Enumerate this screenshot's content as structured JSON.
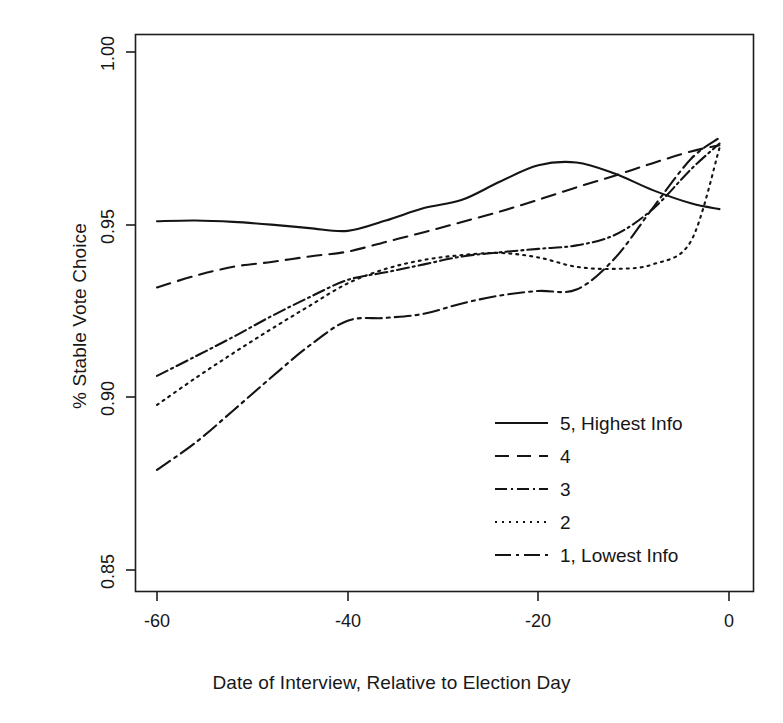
{
  "chart_data": {
    "type": "line",
    "title": "",
    "xlabel": "Date of Interview, Relative to Election Day",
    "ylabel": "% Stable Vote Choice",
    "xlim": [
      -64,
      -0.5
    ],
    "ylim": [
      0.845,
      1.003
    ],
    "xticks": [
      -60,
      -40,
      -20,
      0
    ],
    "xtick_labels": [
      "-60",
      "-40",
      "-20",
      "0"
    ],
    "yticks": [
      0.85,
      0.9,
      0.95,
      1.0
    ],
    "ytick_labels": [
      "0.85",
      "0.90",
      "0.95",
      "1.00"
    ],
    "grid": false,
    "legend_position": "bottom-right",
    "x": [
      -60,
      -56,
      -52,
      -48,
      -44,
      -40,
      -36,
      -32,
      -28,
      -24,
      -20,
      -16,
      -12,
      -8,
      -4,
      -1
    ],
    "series": [
      {
        "name": "5, Highest Info",
        "label": "5, Highest Info",
        "dash": "solid",
        "dasharray": "none",
        "color": "#141414",
        "values": [
          0.951,
          0.9512,
          0.9508,
          0.95,
          0.949,
          0.9482,
          0.9512,
          0.9548,
          0.9572,
          0.9625,
          0.9672,
          0.968,
          0.9648,
          0.96,
          0.9562,
          0.9545
        ]
      },
      {
        "name": "4",
        "label": "4",
        "dash": "dashed",
        "dasharray": "14,8",
        "color": "#141414",
        "values": [
          0.9318,
          0.9352,
          0.9378,
          0.9392,
          0.9408,
          0.9422,
          0.945,
          0.9478,
          0.9508,
          0.9538,
          0.9572,
          0.9608,
          0.9642,
          0.9678,
          0.9712,
          0.973
        ]
      },
      {
        "name": "3",
        "label": "3",
        "dash": "dash-dot",
        "dasharray": "12,4,2,4",
        "color": "#141414",
        "values": [
          0.9062,
          0.9118,
          0.9175,
          0.9235,
          0.929,
          0.934,
          0.9362,
          0.9385,
          0.9408,
          0.942,
          0.943,
          0.944,
          0.947,
          0.9545,
          0.966,
          0.9735
        ]
      },
      {
        "name": "2",
        "label": "2",
        "dash": "dotted",
        "dasharray": "2,5",
        "color": "#141414",
        "values": [
          0.8978,
          0.9055,
          0.9128,
          0.9198,
          0.9265,
          0.933,
          0.9372,
          0.9398,
          0.9412,
          0.9418,
          0.9405,
          0.9378,
          0.9372,
          0.9385,
          0.9452,
          0.9722
        ]
      },
      {
        "name": "1, Lowest Info",
        "label": "1, Lowest Info",
        "dash": "long-dash-dot",
        "dasharray": "16,5,3,5",
        "color": "#141414",
        "values": [
          0.879,
          0.8868,
          0.8962,
          0.9058,
          0.915,
          0.9222,
          0.923,
          0.9242,
          0.9272,
          0.9295,
          0.9308,
          0.9312,
          0.9402,
          0.9548,
          0.969,
          0.9752
        ]
      }
    ]
  },
  "axes": {
    "x_title": "Date of Interview, Relative to Election Day",
    "y_title": "% Stable Vote Choice",
    "x_tick_labels": [
      "-60",
      "-40",
      "-20",
      "0"
    ],
    "y_tick_labels": [
      "0.85",
      "0.90",
      "0.95",
      "1.00"
    ]
  },
  "legend": {
    "entries": [
      {
        "label": "5, Highest Info"
      },
      {
        "label": "4"
      },
      {
        "label": "3"
      },
      {
        "label": "2"
      },
      {
        "label": "1, Lowest Info"
      }
    ]
  }
}
